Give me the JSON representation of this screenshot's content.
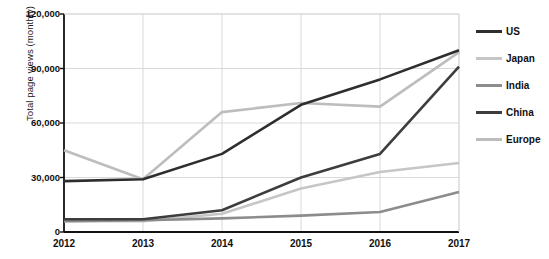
{
  "chart_data": {
    "type": "line",
    "title": "",
    "xlabel": "",
    "ylabel": "Total page views (monthly)",
    "categories": [
      "2012",
      "2013",
      "2014",
      "2015",
      "2016",
      "2017"
    ],
    "x": [
      2012,
      2013,
      2014,
      2015,
      2016,
      2017
    ],
    "xlim": [
      2012,
      2017
    ],
    "ylim": [
      0,
      120000
    ],
    "yticks": [
      0,
      30000,
      60000,
      90000,
      120000
    ],
    "ytick_labels": [
      "0",
      "30,000",
      "60,000",
      "90,000",
      "120,000"
    ],
    "grid": true,
    "grid_axis": "both",
    "legend_position": "right",
    "series": [
      {
        "name": "US",
        "color": "#2e2e2e",
        "values": [
          28000,
          29000,
          43000,
          70000,
          84000,
          100000
        ]
      },
      {
        "name": "Japan",
        "color": "#c6c6c6",
        "values": [
          6000,
          6000,
          10000,
          24000,
          33000,
          38000
        ]
      },
      {
        "name": "India",
        "color": "#8c8c8c",
        "values": [
          6000,
          6500,
          7500,
          9000,
          11000,
          22000
        ]
      },
      {
        "name": "China",
        "color": "#3d3d3d",
        "values": [
          7000,
          7000,
          12000,
          30000,
          43000,
          91000
        ]
      },
      {
        "name": "Europe",
        "color": "#bdbdbd",
        "values": [
          45000,
          29000,
          66000,
          71000,
          69000,
          99000
        ]
      }
    ]
  },
  "legend": {
    "items": [
      {
        "label": "US"
      },
      {
        "label": "Japan"
      },
      {
        "label": "India"
      },
      {
        "label": "China"
      },
      {
        "label": "Europe"
      }
    ]
  },
  "axes": {
    "y_title": "Total page views (monthly)",
    "axis_color": "#111111",
    "grid_color": "#d9d9d9"
  }
}
